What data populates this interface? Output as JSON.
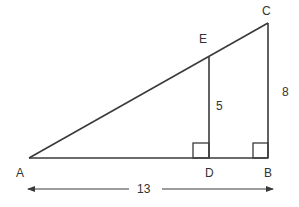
{
  "diagram": {
    "type": "similar-right-triangles",
    "stroke_color": "#3a3a3a",
    "label_color": "#333333",
    "points": {
      "A": {
        "label": "A",
        "x": 29,
        "y": 158
      },
      "B": {
        "label": "B",
        "x": 268,
        "y": 158
      },
      "C": {
        "label": "C",
        "x": 268,
        "y": 23
      },
      "D": {
        "label": "D",
        "x": 209,
        "y": 158
      },
      "E": {
        "label": "E",
        "x": 209,
        "y": 57
      }
    },
    "segments": [
      "AB",
      "BC",
      "AC",
      "ED"
    ],
    "right_angles": [
      "D",
      "B"
    ],
    "measurements": {
      "ED": "5",
      "BC": "8",
      "AB": "13"
    }
  }
}
